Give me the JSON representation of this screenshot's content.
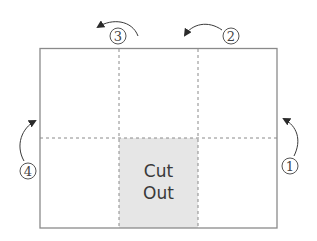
{
  "diagram": {
    "type": "fold-diagram",
    "panels": {
      "rows": 2,
      "cols": 3
    },
    "cutout": {
      "row": 2,
      "col": 2,
      "label_line1": "Cut",
      "label_line2": "Out",
      "fill": "#e6e6e6"
    },
    "steps": [
      {
        "number": "1",
        "position": "right-side",
        "direction": "up"
      },
      {
        "number": "2",
        "position": "top-right",
        "direction": "left"
      },
      {
        "number": "3",
        "position": "top-left",
        "direction": "left"
      },
      {
        "number": "4",
        "position": "left-side",
        "direction": "up"
      }
    ],
    "colors": {
      "border": "#8a8a8a",
      "dashed": "#8a8a8a",
      "arrow": "#3a3a3a",
      "cutout": "#e6e6e6"
    }
  }
}
